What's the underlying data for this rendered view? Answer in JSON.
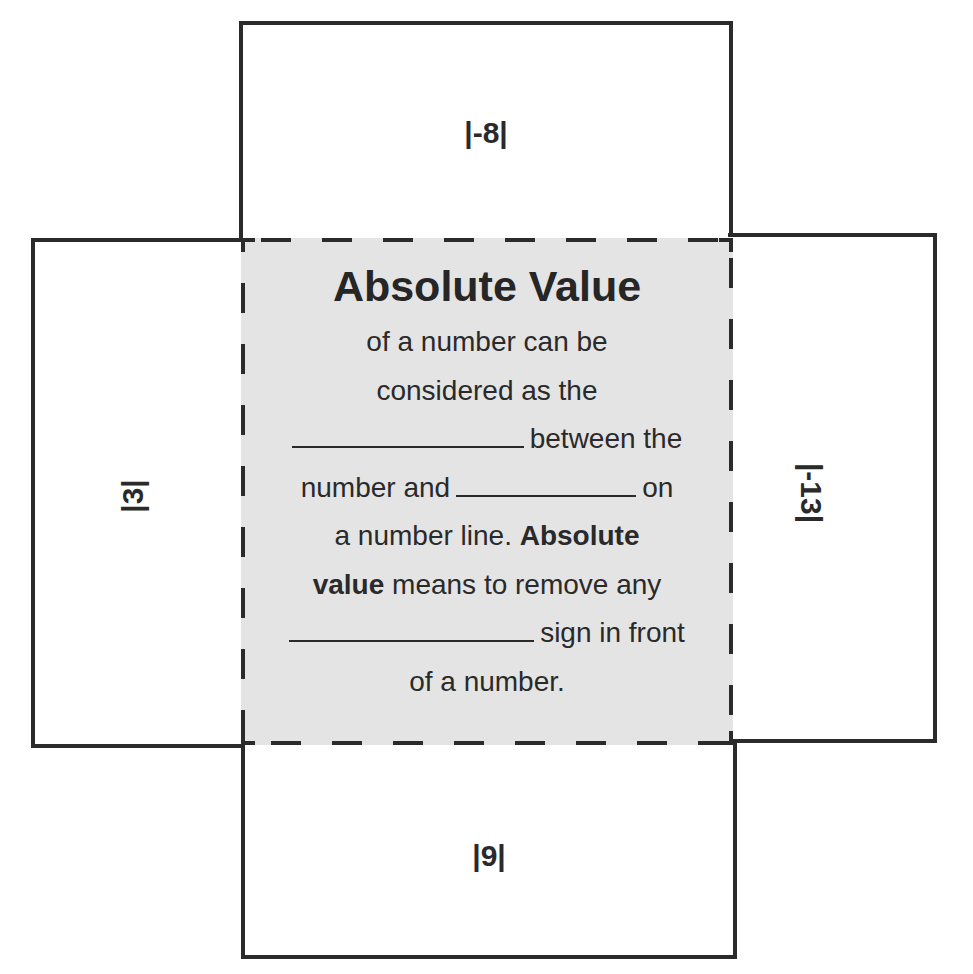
{
  "worksheet": {
    "flaps": {
      "top": {
        "label": "|-8|"
      },
      "left": {
        "label": "|3|"
      },
      "right": {
        "label": "|-13|"
      },
      "bottom": {
        "label": "|9|"
      }
    },
    "center": {
      "title": "Absolute Value",
      "lines": {
        "l1": "of a number can be",
        "l2": "considered as the",
        "l3_after_blank": "between the",
        "l4_before_blank": "number and",
        "l4_after_blank": "on",
        "l5_plain": "a number line.",
        "l5_bold": "Absolute",
        "l6_bold": "value",
        "l6_plain": "means to remove any",
        "l7_after_blank": "sign in front",
        "l8": "of a number."
      },
      "blanks": [
        "",
        "",
        ""
      ]
    },
    "colors": {
      "line": "#2b2b2b",
      "center_fill": "#e4e4e4",
      "text": "#2a2a2a"
    }
  }
}
